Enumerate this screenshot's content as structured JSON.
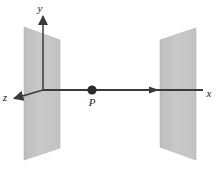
{
  "figure": {
    "background_color": "#ffffff",
    "width": 222,
    "height": 175
  },
  "axes": {
    "origin": {
      "x": 43,
      "y": 90
    },
    "line_color": "#3a3a3a",
    "items": [
      {
        "id": "y-axis",
        "label": "y",
        "label_x": 40,
        "label_y": 12,
        "from": {
          "x": 43,
          "y": 90
        },
        "to": {
          "x": 43,
          "y": 13
        },
        "direction": "up"
      },
      {
        "id": "x-axis",
        "label": "x",
        "label_x": 207,
        "label_y": 96,
        "from": {
          "x": 43,
          "y": 90
        },
        "to": {
          "x": 205,
          "y": 90
        },
        "direction": "right"
      },
      {
        "id": "z-axis",
        "label": "z",
        "label_x": 4,
        "label_y": 100,
        "from": {
          "x": 43,
          "y": 90
        },
        "to": {
          "x": 12,
          "y": 99
        },
        "direction": "down-left"
      }
    ]
  },
  "plates": {
    "fill_color": "#c6c6c6",
    "edge_color": "#b0b0b0",
    "items": [
      {
        "id": "left-plate",
        "name": "left-charged-plate",
        "points": "24,27 60,40 60,148 24,160"
      },
      {
        "id": "right-plate",
        "name": "right-charged-plate",
        "points": "160,40 196,28 196,160 160,147"
      }
    ]
  },
  "points": [
    {
      "id": "point-p",
      "label": "P",
      "x": 92,
      "y": 90,
      "radius": 4.6,
      "color": "#2b2b2b",
      "label_x": 92,
      "label_y": 105
    }
  ]
}
